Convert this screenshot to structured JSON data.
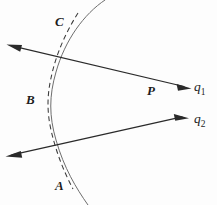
{
  "figure": {
    "background_color": "#fdfdfd",
    "line_color": "#2a2a2a",
    "arc_color": "#6d6d6d",
    "dashed_color": "#3a3a3a",
    "width": 217,
    "height": 205,
    "point_labels": [
      {
        "id": "C",
        "text": "C",
        "x": 60,
        "y": 22
      },
      {
        "id": "B",
        "text": "B",
        "x": 32,
        "y": 100
      },
      {
        "id": "A",
        "text": "A",
        "x": 60,
        "y": 186
      },
      {
        "id": "P",
        "text": "P",
        "x": 152,
        "y": 91
      }
    ],
    "ray_labels": [
      {
        "id": "q1",
        "base": "q",
        "sub": "1",
        "x": 200,
        "y": 87
      },
      {
        "id": "q2",
        "base": "q",
        "sub": "2",
        "x": 200,
        "y": 119
      }
    ],
    "rays": [
      {
        "id": "ray-q1",
        "from": {
          "x": 8,
          "y": 45
        },
        "to": {
          "x": 190,
          "y": 88
        },
        "crossing_point": {
          "x": 155,
          "y": 103
        },
        "arrow_heads": [
          "start",
          "end"
        ]
      },
      {
        "id": "ray-q2",
        "from": {
          "x": 7,
          "y": 156
        },
        "to": {
          "x": 188,
          "y": 118
        },
        "crossing_point": {
          "x": 155,
          "y": 103
        },
        "arrow_heads": [
          "start",
          "end"
        ]
      }
    ],
    "curves": [
      {
        "id": "solid-arc",
        "style": "solid",
        "description": "wavefront arc through C and A"
      },
      {
        "id": "dashed-curve",
        "style": "dashed",
        "description": "dashed curve tangent near B"
      }
    ]
  }
}
